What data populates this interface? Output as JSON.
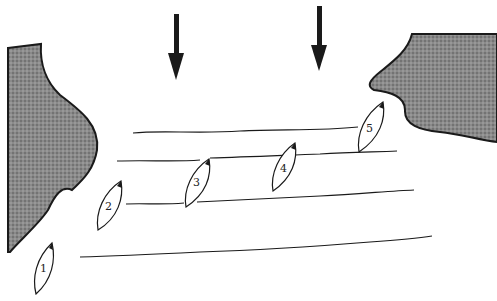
{
  "diagram": {
    "colors": {
      "ink": "#1a1a1a",
      "land": "#7a7a7a",
      "background": "#ffffff"
    },
    "wind_arrows": [
      {
        "id": "arrow-left",
        "x": 176,
        "y1": 14,
        "y2": 80
      },
      {
        "id": "arrow-right",
        "x": 320,
        "y1": 6,
        "y2": 71
      }
    ],
    "landmasses": [
      {
        "id": "left-shore"
      },
      {
        "id": "right-shore"
      }
    ],
    "boats": [
      {
        "label": "1",
        "cx": 45,
        "cy": 268
      },
      {
        "label": "2",
        "cx": 110,
        "cy": 204
      },
      {
        "label": "3",
        "cx": 197,
        "cy": 181
      },
      {
        "label": "4",
        "cx": 284,
        "cy": 167
      },
      {
        "label": "5",
        "cx": 372,
        "cy": 126
      }
    ]
  }
}
